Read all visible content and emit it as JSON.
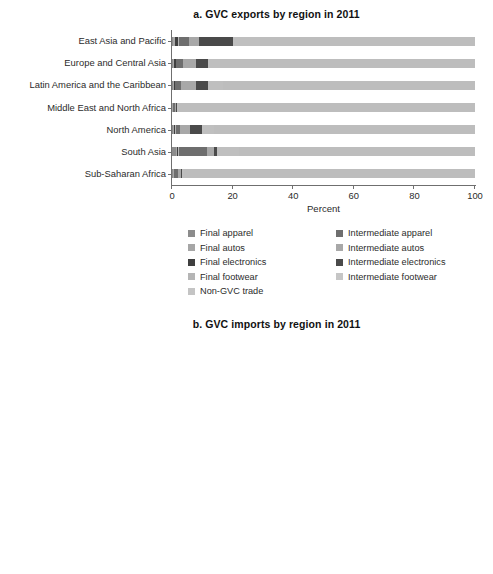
{
  "figure": {
    "xlabel": "Percent"
  },
  "chart_data": [
    {
      "id": "a",
      "type": "bar",
      "orientation": "horizontal",
      "stacked": true,
      "title": "a. GVC exports by region in 2011",
      "xlabel": "Percent",
      "ylabel": "",
      "xlim": [
        0,
        100
      ],
      "xticks": [
        0,
        20,
        40,
        60,
        80,
        100
      ],
      "xticklabels": [
        "0",
        "20",
        "40",
        "60",
        "80",
        "100"
      ],
      "grid": false,
      "legend_position": "below",
      "categories": [
        "East Asia and Pacific",
        "Europe and Central Asia",
        "Latin America and the Caribbean",
        "Middle East and North Africa",
        "North America",
        "South Asia",
        "Sub-Saharan Africa"
      ],
      "series": [
        {
          "name": "Final apparel",
          "color": "#8c8c8c",
          "values": [
            0.4,
            0.3,
            0.2,
            0.1,
            0.2,
            1.2,
            0.3
          ]
        },
        {
          "name": "Final autos",
          "color": "#a6a6a6",
          "values": [
            0.6,
            0.4,
            0.4,
            0.1,
            0.5,
            0.5,
            0.2
          ]
        },
        {
          "name": "Final electronics",
          "color": "#3f3f3f",
          "values": [
            1.0,
            0.5,
            0.3,
            0.1,
            0.4,
            0.4,
            0.2
          ]
        },
        {
          "name": "Final footwear",
          "color": "#b5b5b5",
          "values": [
            0.3,
            0.2,
            0.1,
            0.1,
            0.1,
            0.3,
            0.1
          ]
        },
        {
          "name": "Intermediate apparel",
          "color": "#6e6e6e",
          "values": [
            3.3,
            2.4,
            2.0,
            0.5,
            1.5,
            9.0,
            1.2
          ]
        },
        {
          "name": "Intermediate autos",
          "color": "#a8a8a8",
          "values": [
            3.4,
            4.2,
            5.0,
            0.4,
            3.3,
            2.6,
            1.0
          ]
        },
        {
          "name": "Intermediate electronics",
          "color": "#4a4a4a",
          "values": [
            11.0,
            4.0,
            4.0,
            0.3,
            4.0,
            0.8,
            0.4
          ]
        },
        {
          "name": "Intermediate footwear",
          "color": "#bfbfbf",
          "values": [
            9.0,
            4.0,
            5.0,
            0.4,
            4.0,
            7.2,
            0.6
          ]
        },
        {
          "name": "Non-GVC trade",
          "color": "#bdbdbd",
          "values": [
            71.0,
            84.0,
            83.0,
            98.0,
            86.0,
            78.0,
            96.0
          ]
        }
      ]
    },
    {
      "id": "b",
      "type": "bar",
      "orientation": "horizontal",
      "stacked": true,
      "title": "b. GVC imports by region in 2011",
      "xlabel": "Percent",
      "ylabel": "",
      "xlim": [
        0,
        100
      ],
      "xticks": [
        0,
        20,
        40,
        60,
        80,
        100
      ],
      "xticklabels": [
        "0",
        "20",
        "40",
        "60",
        "80",
        "100"
      ],
      "grid": false,
      "legend_position": "below",
      "categories": [
        "East Asia and Pacific",
        "Europe and Central Asia",
        "Latin America and the Caribbean",
        "Middle East and North Africa",
        "North America",
        "South Asia",
        "Sub-Saharan Africa"
      ],
      "series": [
        {
          "name": "Intermediate apparel",
          "color": "#6e6e6e",
          "values": [
            1.0,
            0.4,
            1.4,
            1.8,
            0.5,
            2.0,
            1.2
          ]
        },
        {
          "name": "Intermediate autos",
          "color": "#b0b0b0",
          "values": [
            1.8,
            4.8,
            5.2,
            2.6,
            8.4,
            1.4,
            2.5
          ]
        },
        {
          "name": "Intermediate electronics",
          "color": "#4a4a4a",
          "values": [
            10.2,
            2.4,
            7.2,
            1.4,
            2.0,
            1.6,
            1.0
          ]
        },
        {
          "name": "Intermediate footwear",
          "color": "#c6c6c6",
          "values": [
            0.6,
            0.6,
            0.8,
            0.6,
            0.5,
            0.6,
            0.5
          ]
        },
        {
          "name": "Other",
          "color": "#ababab",
          "values": [
            86.4,
            91.8,
            85.4,
            93.6,
            88.6,
            94.4,
            94.8
          ]
        }
      ]
    }
  ],
  "legends": {
    "a": {
      "left_column": [
        {
          "label": "Final apparel",
          "color": "#8c8c8c"
        },
        {
          "label": "Final autos",
          "color": "#a6a6a6"
        },
        {
          "label": "Final electronics",
          "color": "#3f3f3f"
        },
        {
          "label": "Final footwear",
          "color": "#b5b5b5"
        },
        {
          "label": "Non-GVC trade",
          "color": "#c4c4c4"
        }
      ],
      "right_column": [
        {
          "label": "Intermediate apparel",
          "color": "#6e6e6e"
        },
        {
          "label": "Intermediate autos",
          "color": "#a8a8a8"
        },
        {
          "label": "Intermediate electronics",
          "color": "#4a4a4a"
        },
        {
          "label": "Intermediate footwear",
          "color": "#c6c6c6"
        }
      ]
    },
    "b": {
      "left_column": [
        {
          "label": "Intermediate apparel",
          "color": "#6e6e6e"
        },
        {
          "label": "Intermediate autos",
          "color": "#b0b0b0"
        },
        {
          "label": "Intermediate electronics",
          "color": "#4a4a4a"
        }
      ],
      "right_column": [
        {
          "label": "Intermediate footwear",
          "color": "#c6c6c6"
        },
        {
          "label": "Other",
          "color": "#ababab"
        }
      ]
    }
  }
}
